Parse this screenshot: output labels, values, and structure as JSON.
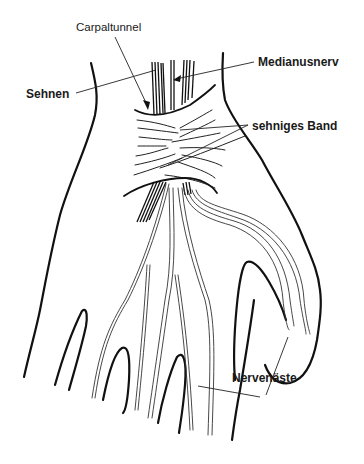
{
  "diagram": {
    "labels": {
      "carpaltunnel": "Carpaltunnel",
      "sehnen": "Sehnen",
      "medianusnerv": "Medianusnerv",
      "sehniges_band": "sehniges Band",
      "nervenaeste": "Nervenäste"
    },
    "colors": {
      "line": "#111111",
      "background": "#ffffff"
    }
  }
}
